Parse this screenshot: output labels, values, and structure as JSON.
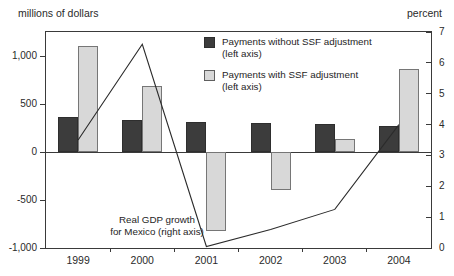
{
  "chart_data": {
    "type": "bar",
    "categories": [
      "1999",
      "2000",
      "2001",
      "2002",
      "2003",
      "2004"
    ],
    "series": [
      {
        "name": "Payments without SSF adjustment (left axis)",
        "axis": "left",
        "color": "#3c3c3c",
        "values": [
          360,
          330,
          310,
          300,
          290,
          270
        ]
      },
      {
        "name": "Payments with SSF adjustment (left axis)",
        "axis": "left",
        "color": "#d8d8d8",
        "values": [
          1100,
          690,
          -820,
          -400,
          140,
          860
        ]
      }
    ],
    "line_series": {
      "name": "Real GDP growth for Mexico (right axis)",
      "axis": "right",
      "color": "#2b2b2b",
      "values": [
        3.5,
        6.6,
        0.05,
        0.6,
        1.25,
        4.0
      ]
    },
    "left_axis": {
      "title": "millions of dollars",
      "tick_labels": [
        "1,000",
        "500",
        "0",
        "-500",
        "-1,000"
      ],
      "tick_values": [
        1000,
        500,
        0,
        -500,
        -1000
      ],
      "range": [
        -1000,
        1250
      ]
    },
    "right_axis": {
      "title": "percent",
      "tick_labels": [
        "7",
        "6",
        "5",
        "4",
        "3",
        "2",
        "1",
        "0"
      ],
      "tick_values": [
        7,
        6,
        5,
        4,
        3,
        2,
        1,
        0
      ],
      "range": [
        0,
        7
      ]
    },
    "legend": [
      {
        "label": "Payments without SSF adjustment",
        "sublabel": "(left axis)",
        "swatch": "dark"
      },
      {
        "label": "Payments with SSF adjustment",
        "sublabel": "(left axis)",
        "swatch": "light"
      }
    ],
    "annotation": {
      "line1": "Real GDP growth",
      "line2": "for Mexico (right axis)"
    },
    "grid": false,
    "legend_position": "top-center-inside"
  }
}
